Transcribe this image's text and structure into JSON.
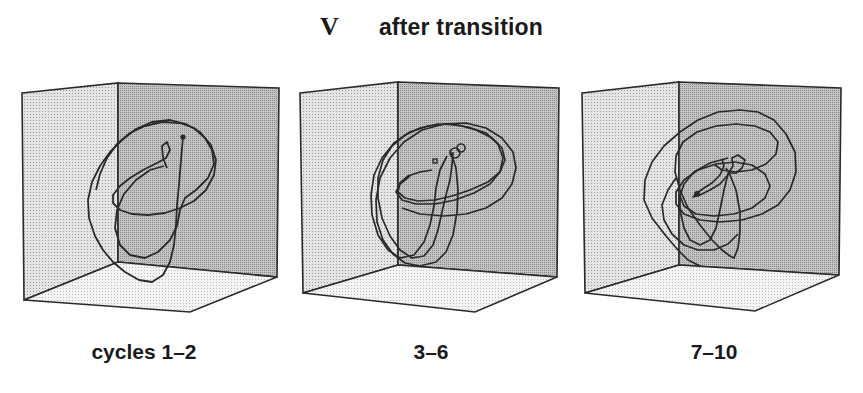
{
  "figure": {
    "panel_label": "V",
    "title": "after transition"
  },
  "panels": [
    {
      "caption": "cycles 1–2"
    },
    {
      "caption": "3–6"
    },
    {
      "caption": "7–10"
    }
  ],
  "colors": {
    "left_wall": "#d6d6d6",
    "back_wall": "#b9b9b9",
    "floor": "#ececec",
    "line": "#2a2a2a"
  }
}
